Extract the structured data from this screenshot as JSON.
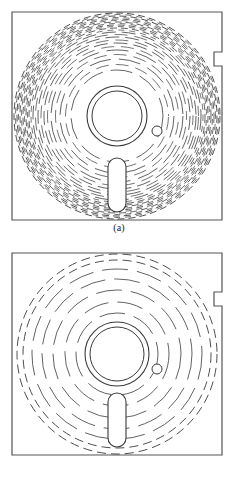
{
  "figure": {
    "panels": [
      {
        "id": "a",
        "caption": "(a)",
        "description": "floppy disk with high density of concentric tracks",
        "frame": {
          "x": 12,
          "y": 12,
          "width": 210,
          "height": 208
        },
        "notch": {
          "x": 222,
          "y": 52,
          "width": 8,
          "height": 14
        },
        "disk": {
          "cx": 117,
          "cy": 116,
          "r": 103
        },
        "hub_outer": {
          "cx": 117,
          "cy": 116,
          "r": 30
        },
        "hub_inner": {
          "cx": 117,
          "cy": 116,
          "r": 25
        },
        "index_hole": {
          "cx": 157,
          "cy": 131,
          "r": 5
        },
        "head_slot": {
          "cx": 117,
          "cy": 185,
          "rx": 9,
          "ry": 27
        },
        "track_radii": [
          103,
          100,
          97,
          94,
          91,
          88,
          84,
          79,
          73,
          66,
          57,
          46
        ],
        "track_style": "dashed"
      },
      {
        "id": "b",
        "caption": "(b)",
        "description": "floppy disk with low density of concentric tracks",
        "frame": {
          "x": 12,
          "y": 253,
          "width": 210,
          "height": 202
        },
        "notch": {
          "x": 222,
          "y": 292,
          "width": 8,
          "height": 14
        },
        "disk": {
          "cx": 117,
          "cy": 354,
          "r": 100
        },
        "hub_outer": {
          "cx": 117,
          "cy": 354,
          "r": 32
        },
        "hub_inner": {
          "cx": 117,
          "cy": 354,
          "r": 27
        },
        "index_hole": {
          "cx": 157,
          "cy": 369,
          "r": 5
        },
        "head_slot": {
          "cx": 117,
          "cy": 420,
          "rx": 9,
          "ry": 27
        },
        "track_radii": [
          100,
          94,
          85,
          75,
          64,
          52,
          41
        ],
        "track_style": "mixed"
      }
    ]
  },
  "colors": {
    "background": "#ffffff",
    "line": "#3a3a3a",
    "frame": "#555555",
    "caption": "#1a1a1a"
  },
  "chart_data": {
    "type": "diagram",
    "title": "",
    "subtitle": "",
    "panels": [
      {
        "label": "(a)",
        "track_count": 12,
        "outer_radius": 103,
        "inner_radius": 46,
        "hub_radius": 30,
        "style": "dashed-dense"
      },
      {
        "label": "(b)",
        "track_count": 7,
        "outer_radius": 100,
        "inner_radius": 41,
        "hub_radius": 32,
        "style": "dashed-sparse"
      }
    ]
  }
}
